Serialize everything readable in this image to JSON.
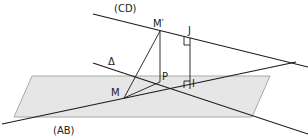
{
  "diagram": {
    "type": "3d-geometry-figure",
    "colors": {
      "plane_fill": "#e6e6e6",
      "plane_stroke": "#a8a8a8",
      "line": "#1a1a1a",
      "label": "#222222"
    },
    "plane": {
      "points": "32,76 270,76 252,117 14,117"
    },
    "lines": {
      "CD": {
        "x1": 93,
        "y1": 14,
        "x2": 308,
        "y2": 67
      },
      "AB": {
        "x1": 2,
        "y1": 124,
        "x2": 296,
        "y2": 62
      },
      "delta": {
        "x1": 93,
        "y1": 63,
        "x2": 308,
        "y2": 134
      }
    },
    "segments": {
      "M_Mprime": {
        "x1": 124,
        "y1": 98,
        "x2": 160,
        "y2": 31
      },
      "Mprime_P": {
        "x1": 160,
        "y1": 31,
        "x2": 160,
        "y2": 82
      },
      "J_I": {
        "x1": 190,
        "y1": 38,
        "x2": 190,
        "y2": 89
      },
      "M_P": {
        "x1": 124,
        "y1": 98,
        "x2": 160,
        "y2": 82
      },
      "M_I": {
        "x1": 124,
        "y1": 98,
        "x2": 190,
        "y2": 89
      }
    },
    "labels": {
      "CD": "(CD)",
      "AB": "(AB)",
      "delta": "Δ",
      "M": "M",
      "Mprime": "M′",
      "J": "J",
      "P": "P",
      "I": "I"
    },
    "right_angle_marks": [
      "J",
      "I"
    ]
  }
}
